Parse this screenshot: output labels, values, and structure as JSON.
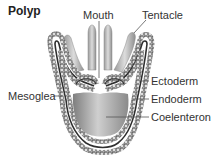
{
  "title": "Polyp",
  "labels": {
    "mouth": "Mouth",
    "tentacle": "Tentacle",
    "ectoderm": "Ectoderm",
    "endoderm": "Endoderm",
    "coelenteron": "Coelenteron",
    "mesoglea": "Mesoglea"
  },
  "colors": {
    "cell_fill": "#d9d9d9",
    "cell_outline": "#444444",
    "mesoglea_band": "#333333",
    "body_gradient_dark": "#8c8c8c",
    "body_gradient_light": "#e0e0e0",
    "leader_line": "#555555"
  }
}
